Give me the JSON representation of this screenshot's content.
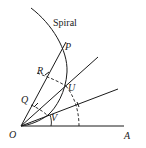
{
  "diagram": {
    "title": "Spiral",
    "points": {
      "O": "O",
      "A": "A",
      "P": "P",
      "U": "U",
      "V": "V",
      "R": "R",
      "Q": "Q"
    },
    "colors": {
      "stroke": "#1a1a1a",
      "background": "#ffffff"
    }
  }
}
